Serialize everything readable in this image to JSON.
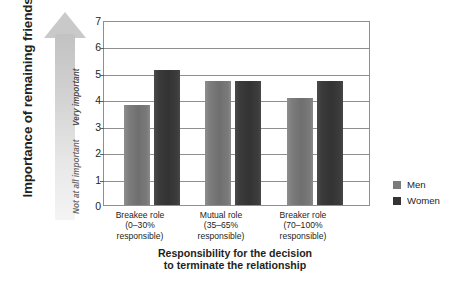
{
  "chart_data": {
    "type": "bar",
    "title": "",
    "xlabel": "Responsibility for the decision to terminate the relationship",
    "ylabel": "Importance of remaining friends",
    "categories": [
      "Breakee role (0–30% responsible)",
      "Mutual role (35–65% responsible)",
      "Breaker role (70–100% responsible)"
    ],
    "series": [
      {
        "name": "Men",
        "values": [
          3.8,
          4.7,
          4.05
        ]
      },
      {
        "name": "Women",
        "values": [
          5.1,
          4.7,
          4.7
        ]
      }
    ],
    "ylim": [
      0,
      7
    ],
    "yticks": [
      0,
      1,
      2,
      3,
      4,
      5,
      6,
      7
    ],
    "grid": true,
    "legend_position": "right"
  },
  "axes": {
    "y_title": "Importance of remaining friends",
    "y_scale_high": "Very important",
    "y_scale_low": "Not at all important",
    "y_tick_labels": [
      "7",
      "6",
      "5",
      "4",
      "3",
      "2",
      "1",
      "0"
    ],
    "x_title_line1": "Responsibility for the decision",
    "x_title_line2": "to terminate the relationship",
    "categories": [
      {
        "line1": "Breakee role",
        "line2": "(0–30%",
        "line3": "responsible)"
      },
      {
        "line1": "Mutual role",
        "line2": "(35–65%",
        "line3": "responsible)"
      },
      {
        "line1": "Breaker role",
        "line2": "(70–100%",
        "line3": "responsible)"
      }
    ]
  },
  "legend": {
    "items": [
      {
        "label": "Men",
        "color": "#7b7b7b"
      },
      {
        "label": "Women",
        "color": "#343434"
      }
    ]
  },
  "colors": {
    "men": "#7b7b7b",
    "women": "#343434",
    "axis": "#8f8f8f",
    "text": "#231f20",
    "arrow": "#c9c9c9"
  }
}
